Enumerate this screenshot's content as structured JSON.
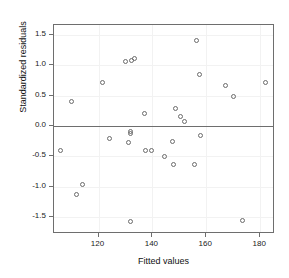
{
  "chart_data": {
    "type": "scatter",
    "title": "",
    "xlabel": "Fitted values",
    "ylabel": "Standardized residuals",
    "xlim": [
      103.5,
      185.5
    ],
    "ylim": [
      -1.78,
      1.66
    ],
    "xticks": [
      120,
      140,
      160,
      180
    ],
    "xtick_labels": [
      "120",
      "140",
      "160",
      "180"
    ],
    "yticks": [
      1.5,
      1.0,
      0.5,
      0.0,
      -0.5,
      -1.0,
      -1.5
    ],
    "ytick_labels": [
      "1.5",
      "1.0",
      "0.5",
      "0.0",
      "-0.5",
      "-1.0",
      "-1.5"
    ],
    "grid": true,
    "legend": null,
    "reference_lines": [
      {
        "axis": "y",
        "value": 0.0,
        "style": "solid",
        "color": "#6e6e6e"
      }
    ],
    "marker": {
      "shape": "open-circle",
      "size": 5,
      "edge_color": "#6b6b6b",
      "fill": "none"
    },
    "series": [
      {
        "name": "residuals",
        "x": [
          106.0,
          110.0,
          112.0,
          114.0,
          121.5,
          124.0,
          130.0,
          131.0,
          132.0,
          132.0,
          132.0,
          132.3,
          133.5,
          137.0,
          137.5,
          139.5,
          144.5,
          147.5,
          148.0,
          148.5,
          150.5,
          152.0,
          155.5,
          156.5,
          157.5,
          158.0,
          167.0,
          170.0,
          173.5,
          182.0
        ],
        "y": [
          -0.41,
          0.4,
          -1.13,
          -0.96,
          0.71,
          -0.2,
          1.06,
          -0.27,
          -0.09,
          -0.12,
          -1.58,
          1.08,
          1.11,
          0.2,
          -0.4,
          -0.41,
          -0.5,
          -0.26,
          -0.63,
          0.28,
          0.16,
          0.07,
          -0.64,
          1.41,
          0.85,
          -0.15,
          0.66,
          0.48,
          -1.56,
          0.71
        ]
      }
    ]
  },
  "axes": {
    "x_title": "Fitted values",
    "y_title": "Standardized residuals"
  }
}
